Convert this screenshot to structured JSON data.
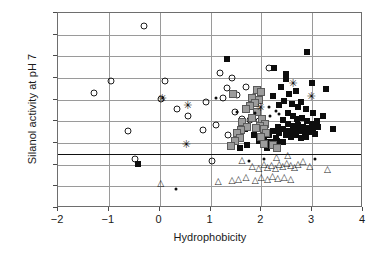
{
  "chart_data": {
    "type": "scatter",
    "title": "",
    "xlabel": "Hydrophobicity",
    "ylabel": "Silanol activity at pH 7",
    "xlim": [
      -2,
      4
    ],
    "ylim": [
      -0.5,
      4
    ],
    "xticks": [
      -2,
      -1,
      0,
      1,
      2,
      3,
      4
    ],
    "xticklabels": [
      "−2",
      "−1",
      "0",
      "1",
      "2",
      "3",
      "4"
    ],
    "yticks": [
      -0.5,
      0,
      0.5,
      1,
      1.5,
      2,
      2.5,
      3,
      3.5,
      4
    ],
    "yticklabels": [
      "−0.5",
      "0",
      "0.5",
      "1",
      "1.5",
      "2",
      "2.5",
      "3",
      "3.5",
      "4"
    ],
    "grid": "both",
    "legend": "none",
    "annotations": [
      {
        "type": "hline",
        "y": 0.75,
        "label": "reference line"
      }
    ],
    "series": [
      {
        "name": "open-circle",
        "marker": "open-circle",
        "color": "#1d1d1d",
        "points": [
          [
            -1.3,
            2.15
          ],
          [
            -0.95,
            2.43
          ],
          [
            -0.62,
            1.28
          ],
          [
            -0.48,
            0.62
          ],
          [
            -0.3,
            3.7
          ],
          [
            0.02,
            2.02
          ],
          [
            0.35,
            1.78
          ],
          [
            0.55,
            1.62
          ],
          [
            0.85,
            1.3
          ],
          [
            0.92,
            1.95
          ],
          [
            1.02,
            0.58
          ],
          [
            1.1,
            1.42
          ],
          [
            1.18,
            2.62
          ],
          [
            1.25,
            2.05
          ],
          [
            1.32,
            2.28
          ],
          [
            1.42,
            2.5
          ],
          [
            1.48,
            1.72
          ],
          [
            1.52,
            2.1
          ],
          [
            1.62,
            1.55
          ],
          [
            1.7,
            2.3
          ],
          [
            1.78,
            1.52
          ],
          [
            1.88,
            2.08
          ],
          [
            1.95,
            1.5
          ],
          [
            2.02,
            1.48
          ],
          [
            2.15,
            2.72
          ],
          [
            0.1,
            2.42
          ],
          [
            1.55,
            1.15
          ],
          [
            1.35,
            1.18
          ]
        ]
      },
      {
        "name": "filled-square",
        "marker": "filled-square",
        "color": "#0d0d0d",
        "points": [
          [
            -0.42,
            0.52
          ],
          [
            1.32,
            2.95
          ],
          [
            2.25,
            2.72
          ],
          [
            2.9,
            3.1
          ],
          [
            2.48,
            2.48
          ],
          [
            3.0,
            2.38
          ],
          [
            3.28,
            2.25
          ],
          [
            2.38,
            2.3
          ],
          [
            2.55,
            2.12
          ],
          [
            2.68,
            2.2
          ],
          [
            2.45,
            1.98
          ],
          [
            2.6,
            1.9
          ],
          [
            2.72,
            1.82
          ],
          [
            2.78,
            1.95
          ],
          [
            2.88,
            1.78
          ],
          [
            3.02,
            1.7
          ],
          [
            3.22,
            1.62
          ],
          [
            2.52,
            1.7
          ],
          [
            2.62,
            1.62
          ],
          [
            2.7,
            1.55
          ],
          [
            2.8,
            1.58
          ],
          [
            2.9,
            1.5
          ],
          [
            3.0,
            1.45
          ],
          [
            3.1,
            1.5
          ],
          [
            2.42,
            1.52
          ],
          [
            2.52,
            1.45
          ],
          [
            2.62,
            1.4
          ],
          [
            2.72,
            1.42
          ],
          [
            2.82,
            1.38
          ],
          [
            2.92,
            1.35
          ],
          [
            3.02,
            1.32
          ],
          [
            3.12,
            1.38
          ],
          [
            2.32,
            1.38
          ],
          [
            2.42,
            1.32
          ],
          [
            2.55,
            1.28
          ],
          [
            2.65,
            1.25
          ],
          [
            2.75,
            1.28
          ],
          [
            2.85,
            1.22
          ],
          [
            2.95,
            1.25
          ],
          [
            3.05,
            1.2
          ],
          [
            3.4,
            1.32
          ],
          [
            2.22,
            1.28
          ],
          [
            2.35,
            1.22
          ],
          [
            2.48,
            1.18
          ],
          [
            2.58,
            1.15
          ],
          [
            2.68,
            1.18
          ],
          [
            2.78,
            1.12
          ],
          [
            2.88,
            1.15
          ],
          [
            2.15,
            1.18
          ],
          [
            2.28,
            1.12
          ],
          [
            2.05,
            1.08
          ],
          [
            1.95,
            1.05
          ],
          [
            2.18,
            1.02
          ],
          [
            2.3,
            1.05
          ],
          [
            2.42,
            1.02
          ],
          [
            1.72,
            0.95
          ],
          [
            1.58,
            0.88
          ],
          [
            2.12,
            0.88
          ],
          [
            2.48,
            2.6
          ],
          [
            2.22,
            2.08
          ],
          [
            2.35,
            1.88
          ],
          [
            1.85,
            1.18
          ],
          [
            1.68,
            1.32
          ]
        ]
      },
      {
        "name": "gray-square",
        "marker": "gray-square",
        "color": "#9c9c9c",
        "points": [
          [
            1.92,
            2.22
          ],
          [
            2.0,
            2.18
          ],
          [
            1.82,
            2.05
          ],
          [
            1.95,
            2.0
          ],
          [
            1.88,
            1.92
          ],
          [
            1.78,
            1.85
          ],
          [
            1.7,
            1.78
          ],
          [
            1.92,
            1.72
          ],
          [
            1.82,
            1.58
          ],
          [
            1.62,
            1.48
          ],
          [
            2.02,
            1.55
          ],
          [
            2.08,
            1.45
          ],
          [
            1.98,
            1.4
          ],
          [
            2.05,
            1.32
          ],
          [
            1.9,
            1.35
          ],
          [
            1.72,
            1.38
          ],
          [
            1.6,
            1.3
          ],
          [
            1.52,
            1.22
          ],
          [
            1.58,
            1.12
          ],
          [
            1.48,
            1.05
          ],
          [
            2.1,
            1.22
          ],
          [
            2.0,
            1.15
          ],
          [
            1.4,
            0.92
          ],
          [
            2.05,
            0.98
          ],
          [
            2.22,
            0.95
          ],
          [
            2.3,
            0.88
          ],
          [
            1.45,
            2.12
          ]
        ]
      },
      {
        "name": "open-triangle",
        "marker": "open-triangle",
        "color": "#1d1d1d",
        "points": [
          [
            0.02,
            0.08
          ],
          [
            1.15,
            0.12
          ],
          [
            1.42,
            0.15
          ],
          [
            1.55,
            0.18
          ],
          [
            1.82,
            0.48
          ],
          [
            1.95,
            0.42
          ],
          [
            2.05,
            0.52
          ],
          [
            2.12,
            0.45
          ],
          [
            2.2,
            0.5
          ],
          [
            2.28,
            0.42
          ],
          [
            2.35,
            0.52
          ],
          [
            2.42,
            0.48
          ],
          [
            2.5,
            0.55
          ],
          [
            2.58,
            0.5
          ],
          [
            2.65,
            0.45
          ],
          [
            2.72,
            0.52
          ],
          [
            2.82,
            0.58
          ],
          [
            2.95,
            0.48
          ],
          [
            3.3,
            0.4
          ],
          [
            2.3,
            0.68
          ],
          [
            2.52,
            0.72
          ],
          [
            2.0,
            0.22
          ],
          [
            2.12,
            0.18
          ],
          [
            2.22,
            0.25
          ],
          [
            2.32,
            0.2
          ],
          [
            1.88,
            0.15
          ],
          [
            1.7,
            0.22
          ],
          [
            2.45,
            0.22
          ],
          [
            2.58,
            0.18
          ],
          [
            1.62,
            0.6
          ]
        ]
      },
      {
        "name": "small-dot",
        "marker": "small-dot",
        "color": "#0d0d0d",
        "points": [
          [
            0.32,
            -0.05
          ],
          [
            1.1,
            2.05
          ],
          [
            1.88,
            1.7
          ],
          [
            2.18,
            1.62
          ],
          [
            2.05,
            0.62
          ],
          [
            3.05,
            0.62
          ],
          [
            1.75,
            0.58
          ],
          [
            2.35,
            1.68
          ],
          [
            2.28,
            1.75
          ],
          [
            2.15,
            1.82
          ],
          [
            1.52,
            1.72
          ]
        ]
      },
      {
        "name": "star",
        "marker": "star",
        "color": "#0d0d0d",
        "points": [
          [
            0.05,
            2.03
          ],
          [
            0.55,
            1.88
          ],
          [
            0.52,
            0.98
          ],
          [
            2.62,
            2.38
          ],
          [
            2.98,
            2.08
          ],
          [
            1.98,
            1.82
          ]
        ]
      }
    ]
  }
}
